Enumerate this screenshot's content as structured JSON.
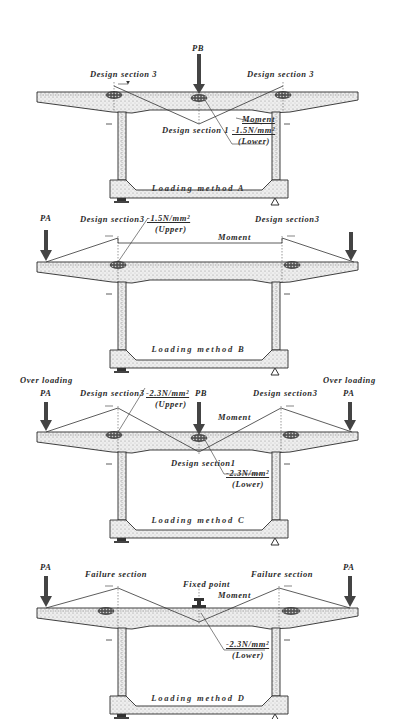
{
  "figure": {
    "colors": {
      "ink": "#2b2b2b",
      "concrete_fill": "#ececec",
      "stipple": "#9a9a9a",
      "background": "#ffffff"
    },
    "panels": [
      {
        "id": "A",
        "caption": "Loading method A",
        "labels": {
          "load_center": "PB",
          "section_left": "Design section 3",
          "section_right": "Design section 3",
          "section_center": "Design section 1",
          "moment": "Moment",
          "stress": "-1.5N/mm²",
          "stress_face": "(Lower)"
        }
      },
      {
        "id": "B",
        "caption": "Loading method B",
        "labels": {
          "load_left": "PA",
          "section_left": "Design section3",
          "section_right": "Design section3",
          "moment": "Moment",
          "stress": "-1.5N/mm²",
          "stress_face": "(Upper)"
        }
      },
      {
        "id": "C",
        "caption": "Loading method C",
        "labels": {
          "overload_left": "Over loading",
          "load_left": "PA",
          "overload_right": "Over loading",
          "load_right": "PA",
          "load_center": "PB",
          "section_left": "Design section3",
          "section_right": "Design section3",
          "section_center": "Design section1",
          "moment": "Moment",
          "stress_upper": "-2.3N/mm²",
          "stress_upper_face": "(Upper)",
          "stress_lower": "-2.3N/mm²",
          "stress_lower_face": "(Lower)"
        }
      },
      {
        "id": "D",
        "caption": "Loading method D",
        "labels": {
          "load_left": "PA",
          "load_right": "PA",
          "section_left": "Failure section",
          "section_right": "Failure section",
          "fixed_point": "Fixed point",
          "moment": "Moment",
          "stress": "-2.3N/mm²",
          "stress_face": "(Lower)"
        }
      }
    ]
  }
}
